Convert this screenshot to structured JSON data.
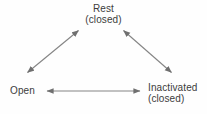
{
  "diagram": {
    "type": "state-transition-cycle",
    "title": "",
    "background_color": "#fefefe",
    "line_color": "#808080",
    "text_color": "#3c3c3c",
    "nodes": [
      {
        "id": "rest",
        "label": "Rest",
        "sublabel": "(closed)",
        "position": "top-center"
      },
      {
        "id": "open",
        "label": "Open",
        "sublabel": "",
        "position": "bottom-left"
      },
      {
        "id": "inactivated",
        "label": "Inactivated",
        "sublabel": "(closed)",
        "position": "bottom-right"
      }
    ],
    "edges": [
      {
        "id": "rest-open",
        "from": "rest",
        "to": "open",
        "style": "double-headed-arrow"
      },
      {
        "id": "rest-inactivated",
        "from": "rest",
        "to": "inactivated",
        "style": "double-headed-arrow"
      },
      {
        "id": "open-inactivated",
        "from": "open",
        "to": "inactivated",
        "style": "double-headed-arrow"
      }
    ]
  }
}
